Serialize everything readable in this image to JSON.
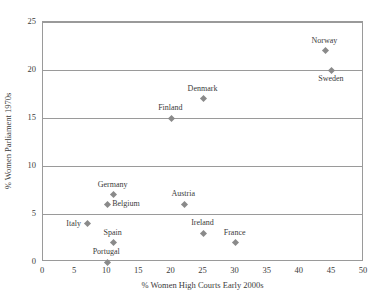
{
  "chart_data": {
    "type": "scatter",
    "title": "",
    "xlabel": "% Women High Courts Early 2000s",
    "ylabel": "% Women Parliament 1970s",
    "xlim": [
      0,
      50
    ],
    "ylim": [
      0,
      25
    ],
    "xticks": [
      0,
      5,
      10,
      15,
      20,
      25,
      30,
      35,
      40,
      45,
      50
    ],
    "yticks": [
      0,
      5,
      10,
      15,
      20,
      25
    ],
    "gridlines_y": [
      5,
      10,
      15,
      20,
      25
    ],
    "grid": "horizontal",
    "legend": "none",
    "marker": "diamond",
    "marker_color": "#8a8a8a",
    "axis_color": "#9a9a9a",
    "points": [
      {
        "label": "Portugal",
        "x": 10,
        "y": 0,
        "label_pos": "above"
      },
      {
        "label": "France",
        "x": 30,
        "y": 2,
        "label_pos": "above"
      },
      {
        "label": "Spain",
        "x": 11,
        "y": 2,
        "label_pos": "above"
      },
      {
        "label": "Ireland",
        "x": 25,
        "y": 3,
        "label_pos": "above"
      },
      {
        "label": "Italy",
        "x": 7,
        "y": 4,
        "label_pos": "left"
      },
      {
        "label": "Austria",
        "x": 22,
        "y": 6,
        "label_pos": "above"
      },
      {
        "label": "Belgium",
        "x": 10,
        "y": 6,
        "label_pos": "right"
      },
      {
        "label": "Germany",
        "x": 11,
        "y": 7,
        "label_pos": "above"
      },
      {
        "label": "Finland",
        "x": 20,
        "y": 15,
        "label_pos": "above"
      },
      {
        "label": "Denmark",
        "x": 25,
        "y": 17,
        "label_pos": "above"
      },
      {
        "label": "Sweden",
        "x": 45,
        "y": 20,
        "label_pos": "below"
      },
      {
        "label": "Norway",
        "x": 44,
        "y": 22,
        "label_pos": "above"
      }
    ]
  }
}
